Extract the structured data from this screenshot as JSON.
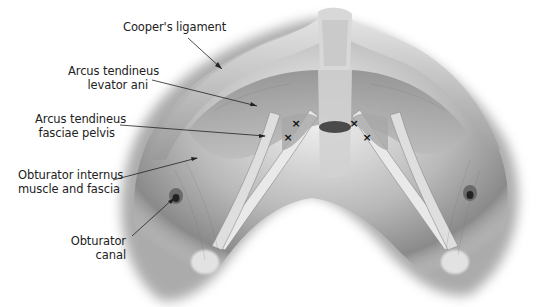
{
  "figure": {
    "labels": [
      {
        "id": "coopers-ligament",
        "lines": [
          "Cooper's ligament"
        ]
      },
      {
        "id": "arcus-tendineus-levator-ani",
        "lines": [
          "Arcus tendineus",
          "levator ani"
        ]
      },
      {
        "id": "arcus-tendineus-fasciae-pelvis",
        "lines": [
          "Arcus tendineus",
          "fasciae pelvis"
        ]
      },
      {
        "id": "obturator-internus",
        "lines": [
          "Obturator internus",
          "muscle and fascia"
        ]
      },
      {
        "id": "obturator-canal",
        "lines": [
          "Obturator",
          "canal"
        ]
      }
    ],
    "markers": {
      "symbol": "×",
      "count": 4
    }
  }
}
